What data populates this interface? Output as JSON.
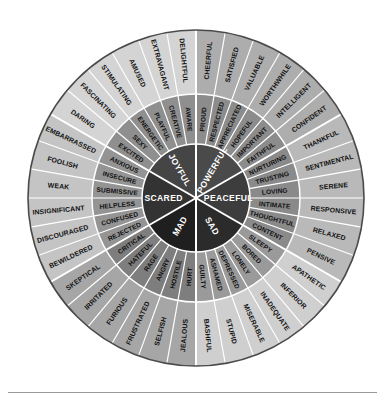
{
  "diagram": {
    "kind": "feelings-wheel",
    "center": {
      "x": 196,
      "y": 198
    },
    "radii": {
      "core": 54,
      "middle": 104,
      "outer": 168
    },
    "segments_per_sector": 6,
    "sector_count": 6,
    "background_color": "#ffffff",
    "rim_color": "#4a4a4a",
    "divider_color": "#ffffff",
    "core_text_color": "#ffffff",
    "ring_text_color": "#111111",
    "footer_rule_color": "#9a9a9a"
  },
  "sectors": [
    {
      "core": "POWERFUL",
      "core_color": "#4a4a4a",
      "middle_color": "#8c8c8c",
      "outer_color": "#adadad",
      "start_angle": -90,
      "middle": [
        "PROUD",
        "RESPECTED",
        "APPRECIATED",
        "HOPEFUL",
        "IMPORTANT",
        "FAITHFUL"
      ],
      "outer": [
        "CHEERFUL",
        "SATISFIED",
        "VALUABLE",
        "WORTHWHILE",
        "INTELLIGENT",
        "CONFIDENT"
      ]
    },
    {
      "core": "PEACEFUL",
      "core_color": "#3d3d3d",
      "middle_color": "#8a8a8a",
      "outer_color": "#b9b9b9",
      "start_angle": -30,
      "middle": [
        "NURTURING",
        "TRUSTING",
        "LOVING",
        "INTIMATE",
        "THOUGHTFUL",
        "CONTENT"
      ],
      "outer": [
        "THANKFUL",
        "SENTIMENTAL",
        "SERENE",
        "RESPONSIVE",
        "RELAXED",
        "PENSIVE"
      ]
    },
    {
      "core": "SAD",
      "core_color": "#2b2b2b",
      "middle_color": "#9a9a9a",
      "outer_color": "#cfcfcf",
      "start_angle": 30,
      "middle": [
        "SLEEPY",
        "BORED",
        "LONELY",
        "DEPRESSED",
        "ASHAMED",
        "GUILTY"
      ],
      "outer": [
        "APATHETIC",
        "INFERIOR",
        "INADEQUATE",
        "MISERABLE",
        "STUPID",
        "BASHFUL"
      ]
    },
    {
      "core": "MAD",
      "core_color": "#1f1f1f",
      "middle_color": "#7e7e7e",
      "outer_color": "#a6a6a6",
      "start_angle": 90,
      "middle": [
        "HURT",
        "HOSTILE",
        "ANGRY",
        "RAGE",
        "HATEFUL",
        "CRITICAL"
      ],
      "outer": [
        "JEALOUS",
        "SELFISH",
        "FRUSTRATED",
        "FURIOUS",
        "IRRITATED",
        "SKEPTICAL"
      ]
    },
    {
      "core": "SCARED",
      "core_color": "#333333",
      "middle_color": "#949494",
      "outer_color": "#c4c4c4",
      "start_angle": 150,
      "middle": [
        "REJECTED",
        "CONFUSED",
        "HELPLESS",
        "SUBMISSIVE",
        "INSECURE",
        "ANXIOUS"
      ],
      "outer": [
        "BEWILDERED",
        "DISCOURAGED",
        "INSIGNIFICANT",
        "WEAK",
        "FOOLISH",
        "EMBARRASSED"
      ]
    },
    {
      "core": "JOYFUL",
      "core_color": "#454545",
      "middle_color": "#8f8f8f",
      "outer_color": "#d4d4d4",
      "start_angle": 210,
      "middle": [
        "EXCITED",
        "SEXY",
        "ENERGETIC",
        "PLAYFUL",
        "CREATIVE",
        "AWARE"
      ],
      "outer": [
        "DARING",
        "FASCINATING",
        "STIMULATING",
        "AMUSED",
        "EXTRAVAGANT",
        "DELIGHTFUL"
      ]
    }
  ],
  "footer": {
    "rule_visible": true
  }
}
